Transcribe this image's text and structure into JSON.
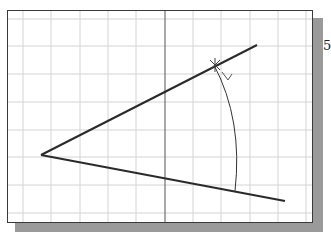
{
  "figure": {
    "type": "CAD angle construction",
    "step_label": "5",
    "grid": {
      "vertical_x": [
        23,
        51,
        80,
        108,
        136,
        193,
        221,
        250,
        278,
        306
      ],
      "horizontal_y": [
        19,
        46,
        74,
        102,
        130,
        157,
        185,
        213
      ],
      "color": "#d4d4d4"
    },
    "axis": {
      "x": 165,
      "color": "#555555"
    },
    "lines": {
      "upper": {
        "x1": 41,
        "y1": 155,
        "x2": 257,
        "y2": 45
      },
      "lower": {
        "x1": 41,
        "y1": 155,
        "x2": 285,
        "y2": 201
      },
      "color": "#2a2a2a"
    },
    "arc": {
      "start": [
        214,
        65
      ],
      "end": [
        235,
        191
      ],
      "color": "#333333"
    },
    "snap_marker": {
      "x": 215,
      "y": 65,
      "label": "intersection-snap"
    }
  }
}
